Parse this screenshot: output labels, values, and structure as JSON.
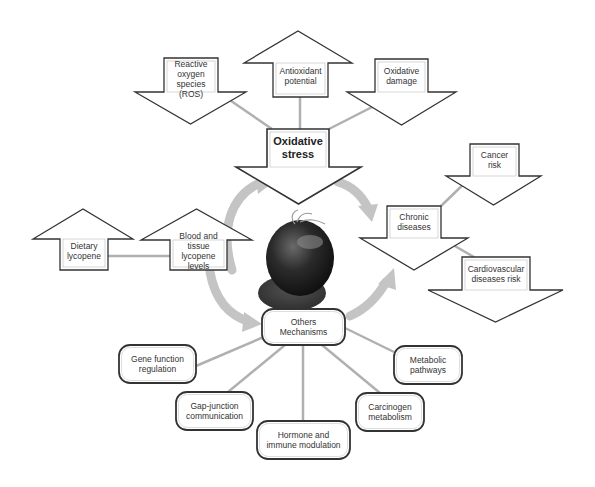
{
  "diagram": {
    "colors": {
      "background": "#ffffff",
      "shape_fill": "#ffffff",
      "shape_stroke": "#333333",
      "connector": "#b0b0b0",
      "cycle_arrow": "#c4c4c4",
      "tomato_dark": "#1e1e1e",
      "tomato_mid": "#555555"
    },
    "center_image": {
      "name": "tomato",
      "cx": 298,
      "cy": 262
    },
    "arrows": [
      {
        "id": "ros",
        "dir": "down",
        "label": "Reactive\noxygen\nspecies\n(ROS)",
        "bold": false,
        "shaft": [
          164,
          58,
          218,
          92
        ],
        "head": [
          135,
          246,
          124
        ]
      },
      {
        "id": "antioxidant",
        "dir": "up",
        "label": "Antioxidant\npotential",
        "bold": false,
        "shaft": [
          273,
          63,
          328,
          97
        ],
        "head": [
          244,
          352,
          31
        ]
      },
      {
        "id": "oxidative-damage",
        "dir": "down",
        "label": "Oxidative\ndamage",
        "bold": false,
        "shaft": [
          375,
          59,
          428,
          92
        ],
        "head": [
          347,
          456,
          125
        ]
      },
      {
        "id": "oxidative-stress",
        "dir": "down",
        "label": "Oxidative\nstress",
        "bold": true,
        "shaft": [
          267,
          129,
          329,
          167
        ],
        "head": [
          236,
          361,
          204
        ]
      },
      {
        "id": "dietary-lycopene",
        "dir": "up",
        "label": "Dietary\nlycopene",
        "bold": false,
        "shaft": [
          60,
          239,
          108,
          270
        ],
        "head": [
          33,
          133,
          209
        ]
      },
      {
        "id": "blood-tissue",
        "dir": "up",
        "label": "Blood and\ntissue\nlycopene\nlevels",
        "bold": false,
        "shaft": [
          170,
          240,
          227,
          270
        ],
        "head": [
          141,
          252,
          209
        ]
      },
      {
        "id": "cancer-risk",
        "dir": "down",
        "label": "Cancer\nrisk",
        "bold": false,
        "shaft": [
          470,
          144,
          519,
          176
        ],
        "head": [
          446,
          541,
          205
        ]
      },
      {
        "id": "chronic-diseases",
        "dir": "down",
        "label": "Chronic\ndiseases",
        "bold": false,
        "shaft": [
          387,
          206,
          441,
          238
        ],
        "head": [
          360,
          468,
          270
        ]
      },
      {
        "id": "cardiovascular",
        "dir": "down",
        "label": "Cardiovascular\ndiseases risk",
        "bold": false,
        "shaft": [
          462,
          257,
          530,
          290
        ],
        "head": [
          428,
          563,
          322
        ]
      }
    ],
    "boxes": [
      {
        "id": "others-mechanisms",
        "label": "Others\nMechanisms",
        "x": 262,
        "y": 309,
        "w": 83,
        "h": 36
      },
      {
        "id": "gene-function",
        "label": "Gene function\nregulation",
        "x": 119,
        "y": 345,
        "w": 77,
        "h": 38
      },
      {
        "id": "gap-junction",
        "label": "Gap-junction\ncommunication",
        "x": 176,
        "y": 392,
        "w": 77,
        "h": 38
      },
      {
        "id": "hormone-immune",
        "label": "Hormone and\nimmune modulation",
        "x": 257,
        "y": 421,
        "w": 93,
        "h": 38
      },
      {
        "id": "carcinogen",
        "label": "Carcinogen\nmetabolism",
        "x": 356,
        "y": 393,
        "w": 68,
        "h": 38
      },
      {
        "id": "metabolic",
        "label": "Metabolic\npathways",
        "x": 394,
        "y": 346,
        "w": 68,
        "h": 38
      }
    ],
    "connectors": [
      [
        218,
        92,
        272,
        129
      ],
      [
        300,
        97,
        300,
        129
      ],
      [
        380,
        103,
        329,
        129
      ],
      [
        108,
        256,
        170,
        256
      ],
      [
        441,
        206,
        472,
        176
      ],
      [
        441,
        238,
        474,
        257
      ],
      [
        280,
        330,
        196,
        366
      ],
      [
        285,
        345,
        228,
        392
      ],
      [
        303,
        345,
        303,
        421
      ],
      [
        322,
        345,
        380,
        393
      ],
      [
        345,
        328,
        394,
        352
      ]
    ]
  }
}
